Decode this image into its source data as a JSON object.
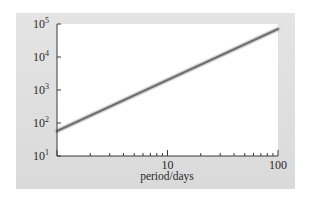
{
  "chart_data": {
    "type": "line",
    "title": "",
    "xlabel": "period/days",
    "ylabel": "luminosity L/L☉",
    "ylabel_parts": {
      "main": "luminosity ",
      "var": "L",
      "slash": "/",
      "var2": "L",
      "sub": "⊙"
    },
    "x_scale": "log",
    "y_scale": "log",
    "xlim": [
      1,
      100
    ],
    "ylim": [
      10,
      100000
    ],
    "x_ticks": [
      {
        "value": 10,
        "label": "10"
      },
      {
        "value": 100,
        "label": "100"
      }
    ],
    "y_ticks": [
      {
        "value": 10,
        "base": "10",
        "exp": "1"
      },
      {
        "value": 100,
        "base": "10",
        "exp": "2"
      },
      {
        "value": 1000,
        "base": "10",
        "exp": "3"
      },
      {
        "value": 10000,
        "base": "10",
        "exp": "4"
      },
      {
        "value": 100000,
        "base": "10",
        "exp": "5"
      }
    ],
    "grid": false,
    "legend": null,
    "series": [
      {
        "name": "period-luminosity relation",
        "x": [
          1,
          10,
          100
        ],
        "y": [
          57,
          2000,
          70000
        ]
      }
    ],
    "colors": {
      "line": "#6e6e6e",
      "line_glow": "#bdbdbd",
      "panel": "#dedede",
      "plot_bg": "#ffffff",
      "axis": "#3a3a3a"
    }
  }
}
